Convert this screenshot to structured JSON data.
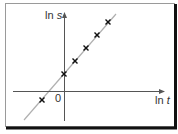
{
  "chart_data": {
    "type": "scatter",
    "title": "",
    "xlabel": "ln t",
    "ylabel": "ln s",
    "origin_label": "0",
    "grid": false,
    "legend": null,
    "points_px": [
      [
        42,
        100
      ],
      [
        64,
        74
      ],
      [
        75,
        61
      ],
      [
        86,
        48
      ],
      [
        97,
        35
      ],
      [
        108,
        22
      ]
    ],
    "points_relative": {
      "x": [
        -2,
        0,
        1,
        2,
        3,
        4
      ],
      "y": [
        -0.8,
        1.5,
        2.7,
        3.9,
        5.1,
        6.2
      ]
    },
    "fit_line_px": {
      "x1": 24,
      "y1": 120,
      "x2": 116,
      "y2": 14
    },
    "marker": "x",
    "colors": {
      "axes": "#555555",
      "fit_line": "#b0b0b0",
      "markers": "#111111",
      "frame_light": "#999999",
      "frame_shadow": "#111111"
    }
  },
  "labels": {
    "y_axis": "ln ",
    "y_axis_var": "s",
    "x_axis": "ln ",
    "x_axis_var": "t",
    "origin": "0"
  }
}
